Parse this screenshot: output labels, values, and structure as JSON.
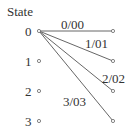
{
  "diagram": {
    "type": "trellis",
    "header": "State",
    "states": [
      "0",
      "1",
      "2",
      "3"
    ],
    "left_nodes": [
      {
        "state": "0",
        "x": 39,
        "y": 31
      },
      {
        "state": "1",
        "x": 39,
        "y": 61
      },
      {
        "state": "2",
        "x": 39,
        "y": 91
      },
      {
        "state": "3",
        "x": 39,
        "y": 121
      }
    ],
    "right_nodes": [
      {
        "state": "0",
        "x": 113,
        "y": 31
      },
      {
        "state": "1",
        "x": 113,
        "y": 61
      },
      {
        "state": "2",
        "x": 113,
        "y": 91
      },
      {
        "state": "3",
        "x": 113,
        "y": 121
      }
    ],
    "transitions": [
      {
        "from": "0",
        "to": "0",
        "label": "0/00"
      },
      {
        "from": "0",
        "to": "1",
        "label": "1/01"
      },
      {
        "from": "0",
        "to": "2",
        "label": "2/02"
      },
      {
        "from": "0",
        "to": "3",
        "label": "3/03"
      }
    ],
    "colors": {
      "line": "#555555",
      "node": "#666666",
      "text": "#333333"
    }
  }
}
